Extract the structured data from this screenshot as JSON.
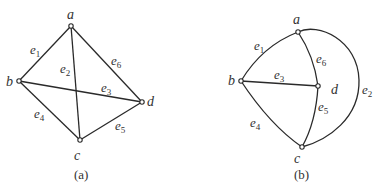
{
  "diagrams": [
    {
      "caption": "(a)",
      "vertices": [
        {
          "id": "a",
          "label": "a",
          "x": 71,
          "y": 26,
          "lx": 70,
          "ly": 19
        },
        {
          "id": "b",
          "label": "b",
          "x": 19,
          "y": 81,
          "lx": 10,
          "ly": 86
        },
        {
          "id": "c",
          "label": "c",
          "x": 80,
          "y": 140,
          "lx": 77,
          "ly": 160
        },
        {
          "id": "d",
          "label": "d",
          "x": 142,
          "y": 102,
          "lx": 151,
          "ly": 106
        }
      ],
      "edges": [
        {
          "id": "e1",
          "base": "e",
          "sub": "1",
          "from": "a",
          "to": "b",
          "lx": 33,
          "ly": 54
        },
        {
          "id": "e2",
          "base": "e",
          "sub": "2",
          "from": "a",
          "to": "c",
          "lx": 62,
          "ly": 74
        },
        {
          "id": "e3",
          "base": "e",
          "sub": "3",
          "from": "b",
          "to": "d",
          "lx": 102,
          "ly": 92
        },
        {
          "id": "e4",
          "base": "e",
          "sub": "4",
          "from": "b",
          "to": "c",
          "lx": 35,
          "ly": 118
        },
        {
          "id": "e5",
          "base": "e",
          "sub": "5",
          "from": "c",
          "to": "d",
          "lx": 116,
          "ly": 130
        },
        {
          "id": "e6",
          "base": "e",
          "sub": "6",
          "from": "a",
          "to": "d",
          "lx": 112,
          "ly": 65
        }
      ]
    },
    {
      "caption": "(b)",
      "vertices": [
        {
          "id": "a",
          "label": "a",
          "x": 298,
          "y": 32,
          "lx": 296,
          "ly": 24
        },
        {
          "id": "b",
          "label": "b",
          "x": 241,
          "y": 81,
          "lx": 229,
          "ly": 85
        },
        {
          "id": "c",
          "label": "c",
          "x": 302,
          "y": 147,
          "lx": 297,
          "ly": 163
        },
        {
          "id": "d",
          "label": "d",
          "x": 318,
          "y": 86,
          "lx": 332,
          "ly": 94
        },
        {
          "id": "dummy",
          "label": "",
          "x": 0,
          "y": 0,
          "lx": 0,
          "ly": 0
        }
      ],
      "edges": [
        {
          "id": "e1",
          "base": "e",
          "sub": "1",
          "from": "a",
          "to": "b",
          "lx": 256,
          "ly": 50
        },
        {
          "id": "e2",
          "base": "e",
          "sub": "2",
          "from": "a",
          "to": "c",
          "lx": 362,
          "ly": 94
        },
        {
          "id": "e3",
          "base": "e",
          "sub": "3",
          "from": "b",
          "to": "d",
          "lx": 275,
          "ly": 80
        },
        {
          "id": "e4",
          "base": "e",
          "sub": "4",
          "from": "b",
          "to": "c",
          "lx": 251,
          "ly": 127
        },
        {
          "id": "e5",
          "base": "e",
          "sub": "5",
          "from": "d",
          "to": "c",
          "lx": 318,
          "ly": 112
        },
        {
          "id": "e6",
          "base": "e",
          "sub": "6",
          "from": "a",
          "to": "d",
          "lx": 315,
          "ly": 64
        }
      ]
    }
  ]
}
